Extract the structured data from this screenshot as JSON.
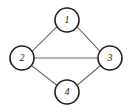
{
  "diagram": {
    "type": "graph",
    "background_color": "#ffffff",
    "node_fill_color": "#ffffff",
    "node_stroke_color": "#231f20",
    "edge_color": "#6d6a67",
    "label_color": "#1d1a19",
    "node_radius": 12,
    "nodes": [
      {
        "id": "1",
        "label": "1",
        "cx": 67,
        "cy": 20,
        "r": 12,
        "position": "top"
      },
      {
        "id": "2",
        "label": "2",
        "cx": 22,
        "cy": 58,
        "r": 12,
        "position": "left"
      },
      {
        "id": "3",
        "label": "3",
        "cx": 110,
        "cy": 58,
        "r": 12,
        "position": "right"
      },
      {
        "id": "4",
        "label": "4",
        "cx": 67,
        "cy": 92,
        "r": 12,
        "position": "bottom"
      }
    ],
    "edges": [
      {
        "id": "edge-1-2",
        "from": "1",
        "to": "2",
        "x1": 57.0,
        "y1": 26.6,
        "x2": 32.0,
        "y2": 51.4
      },
      {
        "id": "edge-1-3",
        "from": "1",
        "to": "3",
        "x1": 77.0,
        "y1": 26.6,
        "x2": 100.0,
        "y2": 51.4
      },
      {
        "id": "edge-2-3",
        "from": "2",
        "to": "3",
        "x1": 34.0,
        "y1": 58.0,
        "x2": 98.0,
        "y2": 58.0
      },
      {
        "id": "edge-2-4",
        "from": "2",
        "to": "4",
        "x1": 31.5,
        "y1": 65.5,
        "x2": 56.5,
        "y2": 85.0
      },
      {
        "id": "edge-4-3",
        "from": "4",
        "to": "3",
        "x1": 77.5,
        "y1": 85.0,
        "x2": 100.5,
        "y2": 65.5
      }
    ]
  }
}
